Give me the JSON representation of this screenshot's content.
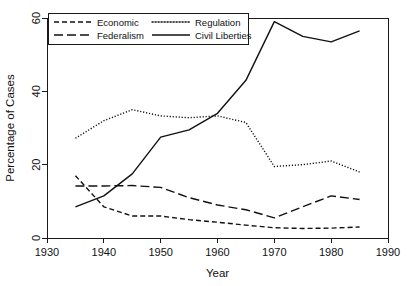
{
  "chart_data": {
    "type": "line",
    "title": "",
    "xlabel": "Year",
    "ylabel": "Percentage of Cases",
    "xlim": [
      1930,
      1990
    ],
    "ylim": [
      0,
      60
    ],
    "xticks": [
      1930,
      1940,
      1950,
      1960,
      1970,
      1980,
      1990
    ],
    "xtick_labels": [
      "1930",
      "1940",
      "1950",
      "1960",
      "1970",
      "1980",
      "1990"
    ],
    "yticks": [
      0,
      20,
      40,
      60
    ],
    "ytick_labels": [
      "0",
      "20",
      "40",
      "60"
    ],
    "grid": false,
    "legend_position": "top-left",
    "x": [
      1935,
      1940,
      1945,
      1950,
      1955,
      1960,
      1965,
      1970,
      1975,
      1980,
      1985
    ],
    "series": [
      {
        "name": "Economic",
        "dash": "5,3",
        "color": "#111111",
        "values": [
          17.0,
          8.5,
          6.0,
          6.0,
          5.0,
          4.3,
          3.5,
          2.8,
          2.6,
          2.7,
          3.0
        ]
      },
      {
        "name": "Federalism",
        "dash": "9,4",
        "color": "#111111",
        "values": [
          14.2,
          14.2,
          14.3,
          13.8,
          11.0,
          9.0,
          7.7,
          5.5,
          8.5,
          11.5,
          10.5
        ]
      },
      {
        "name": "Regulation",
        "dash": "1.2,1.8",
        "color": "#111111",
        "values": [
          27.2,
          32.0,
          35.0,
          33.3,
          32.8,
          33.3,
          31.5,
          19.5,
          20.0,
          21.0,
          18.0
        ]
      },
      {
        "name": "Civil Liberties",
        "dash": "none",
        "color": "#111111",
        "values": [
          8.5,
          11.5,
          17.5,
          27.5,
          29.5,
          34.0,
          43.0,
          59.0,
          55.0,
          53.5,
          56.5
        ]
      }
    ]
  },
  "legend": {
    "entries": [
      {
        "label": "Economic"
      },
      {
        "label": "Regulation"
      },
      {
        "label": "Federalism"
      },
      {
        "label": "Civil Liberties"
      }
    ]
  }
}
